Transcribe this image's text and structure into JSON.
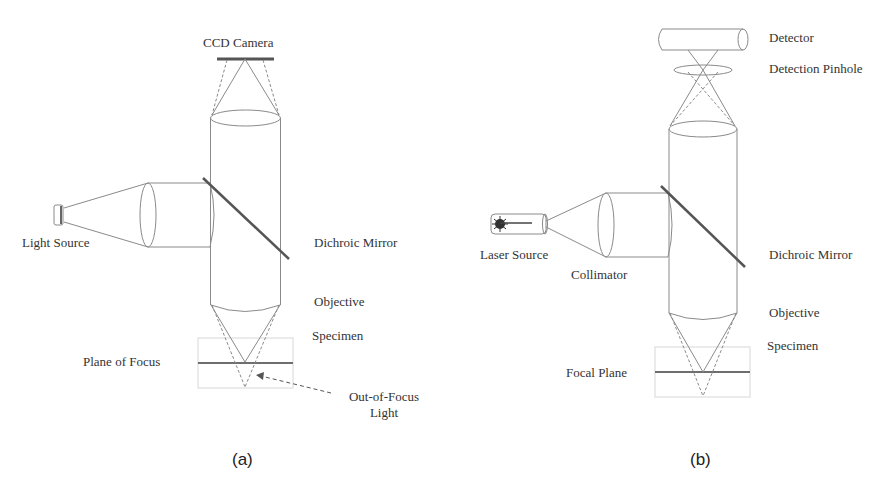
{
  "panel_a": {
    "caption": "(a)",
    "labels": {
      "ccd_camera": "CCD Camera",
      "light_source": "Light Source",
      "dichroic_mirror": "Dichroic Mirror",
      "objective": "Objective",
      "specimen": "Specimen",
      "plane_of_focus": "Plane of Focus",
      "out_of_focus_line1": "Out-of-Focus",
      "out_of_focus_line2": "Light"
    }
  },
  "panel_b": {
    "caption": "(b)",
    "labels": {
      "detector": "Detector",
      "detection_pinhole": "Detection Pinhole",
      "laser_source": "Laser Source",
      "collimator": "Collimator",
      "dichroic_mirror": "Dichroic Mirror",
      "objective": "Objective",
      "specimen": "Specimen",
      "focal_plane": "Focal Plane"
    }
  },
  "colors": {
    "line": "#8a8a8a",
    "mirror": "#555555",
    "plane": "#6e6e6e",
    "box": "#d8d8d8",
    "text": "#333333"
  }
}
